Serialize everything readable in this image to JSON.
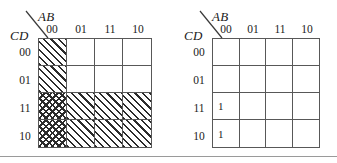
{
  "figure": {
    "maps": [
      {
        "id": "kmap-left",
        "top_label": "AB",
        "side_label": "CD",
        "column_headers": [
          "00",
          "01",
          "11",
          "10"
        ],
        "row_headers": [
          "00",
          "01",
          "11",
          "10"
        ],
        "cells": [
          [
            {
              "value": "",
              "fill": "hatch"
            },
            {
              "value": "",
              "fill": "none"
            },
            {
              "value": "",
              "fill": "none"
            },
            {
              "value": "",
              "fill": "none"
            }
          ],
          [
            {
              "value": "",
              "fill": "hatch"
            },
            {
              "value": "",
              "fill": "none"
            },
            {
              "value": "",
              "fill": "none"
            },
            {
              "value": "",
              "fill": "none"
            }
          ],
          [
            {
              "value": "",
              "fill": "cross"
            },
            {
              "value": "",
              "fill": "hatch"
            },
            {
              "value": "",
              "fill": "hatch"
            },
            {
              "value": "",
              "fill": "hatch"
            }
          ],
          [
            {
              "value": "",
              "fill": "cross"
            },
            {
              "value": "",
              "fill": "hatch"
            },
            {
              "value": "",
              "fill": "hatch"
            },
            {
              "value": "",
              "fill": "hatch"
            }
          ]
        ]
      },
      {
        "id": "kmap-right",
        "top_label": "AB",
        "side_label": "CD",
        "column_headers": [
          "00",
          "01",
          "11",
          "10"
        ],
        "row_headers": [
          "00",
          "01",
          "11",
          "10"
        ],
        "cells": [
          [
            {
              "value": "",
              "fill": "none"
            },
            {
              "value": "",
              "fill": "none"
            },
            {
              "value": "",
              "fill": "none"
            },
            {
              "value": "",
              "fill": "none"
            }
          ],
          [
            {
              "value": "",
              "fill": "none"
            },
            {
              "value": "",
              "fill": "none"
            },
            {
              "value": "",
              "fill": "none"
            },
            {
              "value": "",
              "fill": "none"
            }
          ],
          [
            {
              "value": "1",
              "fill": "none"
            },
            {
              "value": "",
              "fill": "none"
            },
            {
              "value": "",
              "fill": "none"
            },
            {
              "value": "",
              "fill": "none"
            }
          ],
          [
            {
              "value": "1",
              "fill": "none"
            },
            {
              "value": "",
              "fill": "none"
            },
            {
              "value": "",
              "fill": "none"
            },
            {
              "value": "",
              "fill": "none"
            }
          ]
        ]
      }
    ],
    "colors": {
      "grid_line": "#585858",
      "hatch": "#2b2b2b",
      "text": "#1a1a1a",
      "rule": "#9a9a9a",
      "background": "#ffffff"
    }
  }
}
